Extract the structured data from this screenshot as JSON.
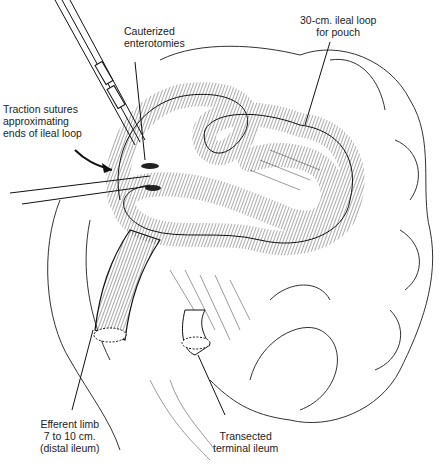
{
  "figure": {
    "type": "surgical line illustration",
    "colors": {
      "background": "#ffffff",
      "ink": "#1a1a1a"
    }
  },
  "labels": {
    "cauterized": "Cauterized\nenterotomies",
    "ileal_loop": "30-cm. ileal loop\nfor pouch",
    "traction": "Traction sutures\napproximating\nends of ileal loop",
    "efferent": "Efferent limb\n7 to 10 cm.\n(distal ileum)",
    "transected": "Transected\nterminal ileum"
  }
}
